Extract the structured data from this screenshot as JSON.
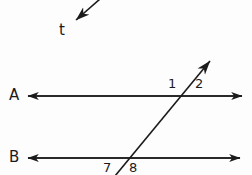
{
  "figure": {
    "type": "geometry-diagram",
    "background_color": "#fdfdfd",
    "stroke_color": "#1b1b1b",
    "width": 252,
    "height": 175
  },
  "labels": {
    "line_a": "A",
    "line_b": "B",
    "transversal": "t",
    "angle_1": "1",
    "angle_2": "2",
    "angle_7": "7",
    "angle_8": "8"
  },
  "geometry": {
    "line_a": {
      "name": "A",
      "y": 96,
      "x_start": 28,
      "x_end": 242,
      "double_arrow": true
    },
    "line_b": {
      "name": "B",
      "y": 158,
      "x_start": 28,
      "x_end": 240,
      "double_arrow": true
    },
    "transversal": {
      "name": "t",
      "x1": 115,
      "y1": 175,
      "x2": 212,
      "y2": 58,
      "arrow_at_top": true
    },
    "pointer": {
      "from_x": 100,
      "from_y": 0,
      "to_x": 75,
      "to_y": 21,
      "target": "t"
    },
    "intersection_a": {
      "x": 183,
      "y": 96
    },
    "intersection_b": {
      "x": 120,
      "y": 158
    }
  },
  "angle_positions": {
    "angle_1": {
      "x": 172,
      "y": 84,
      "relation": "above-left of intersection with A"
    },
    "angle_2": {
      "x": 199,
      "y": 84,
      "relation": "above-right of intersection with A"
    },
    "angle_7": {
      "x": 107,
      "y": 168,
      "relation": "below-left of intersection with B"
    },
    "angle_8": {
      "x": 133,
      "y": 168,
      "relation": "below-right of intersection with B"
    }
  }
}
